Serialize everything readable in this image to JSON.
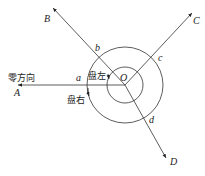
{
  "diagram": {
    "type": "direction-method angle observation",
    "center": {
      "label": "O",
      "x": 125,
      "y": 85
    },
    "circles": [
      {
        "name": "inner",
        "r": 18
      },
      {
        "name": "outer",
        "r": 38
      }
    ],
    "directions": [
      {
        "point": "A",
        "intersection": "a",
        "tip": [
          18,
          85
        ]
      },
      {
        "point": "B",
        "intersection": "b",
        "tip": [
          53,
          8
        ]
      },
      {
        "point": "C",
        "intersection": "c",
        "tip": [
          192,
          13
        ]
      },
      {
        "point": "D",
        "intersection": "d",
        "tip": [
          166,
          158
        ]
      }
    ],
    "labels": {
      "zero_direction": "零方向",
      "face_left": "盘左",
      "face_right": "盘右",
      "O": "O",
      "A": "A",
      "B": "B",
      "C": "C",
      "D": "D",
      "a": "a",
      "b": "b",
      "c": "c",
      "d": "d"
    },
    "color": "#222222"
  }
}
